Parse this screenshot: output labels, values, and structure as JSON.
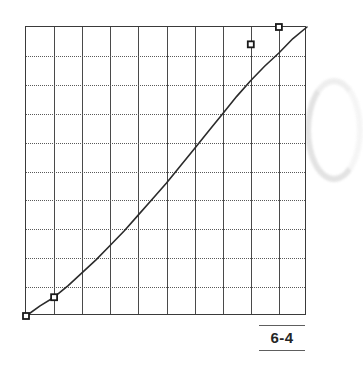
{
  "page": {
    "background_color": "#ffffff",
    "width": 333,
    "height": 381
  },
  "figure": {
    "caption_label": "6-4",
    "caption_rule_color": "#5e5e5e"
  },
  "artifact": {
    "name": "scan-arc",
    "color": "#e2e2e2"
  },
  "chart_data": {
    "type": "line",
    "title": "",
    "subtitle": "",
    "xlabel": "",
    "ylabel": "",
    "xlim": [
      0,
      10
    ],
    "ylim": [
      0,
      10
    ],
    "grid": true,
    "grid_x_lines": 10,
    "grid_y_lines": 10,
    "grid_x_style": "solid",
    "grid_y_style": "dotted",
    "xticks": [
      0,
      1,
      2,
      3,
      4,
      5,
      6,
      7,
      8,
      9,
      10
    ],
    "yticks": [
      0,
      1,
      2,
      3,
      4,
      5,
      6,
      7,
      8,
      9,
      10
    ],
    "xticklabels": [
      "",
      "",
      "",
      "",
      "",
      "",
      "",
      "",
      "",
      "",
      ""
    ],
    "yticklabels": [
      "",
      "",
      "",
      "",
      "",
      "",
      "",
      "",
      "",
      "",
      ""
    ],
    "legend": null,
    "legend_position": "none",
    "line_color": "#2b2b2b",
    "line_width": 1.6,
    "marker_shape": "square",
    "marker_color": "#1a1a1a",
    "series": [
      {
        "name": "curve",
        "x": [
          0.0,
          0.5,
          1.0,
          1.5,
          2.0,
          2.5,
          3.0,
          3.5,
          4.0,
          4.5,
          5.0,
          5.5,
          6.0,
          6.5,
          7.0,
          7.5,
          8.0,
          8.5,
          9.0,
          9.5,
          10.0
        ],
        "y": [
          0.0,
          0.35,
          0.65,
          1.05,
          1.5,
          1.95,
          2.45,
          2.95,
          3.5,
          4.05,
          4.6,
          5.2,
          5.8,
          6.4,
          7.0,
          7.6,
          8.15,
          8.65,
          9.1,
          9.6,
          10.0
        ]
      }
    ],
    "markers": [
      {
        "x": 0.0,
        "y": 0.0
      },
      {
        "x": 1.0,
        "y": 0.65
      },
      {
        "x": 8.0,
        "y": 9.4
      },
      {
        "x": 9.0,
        "y": 10.0
      }
    ]
  }
}
